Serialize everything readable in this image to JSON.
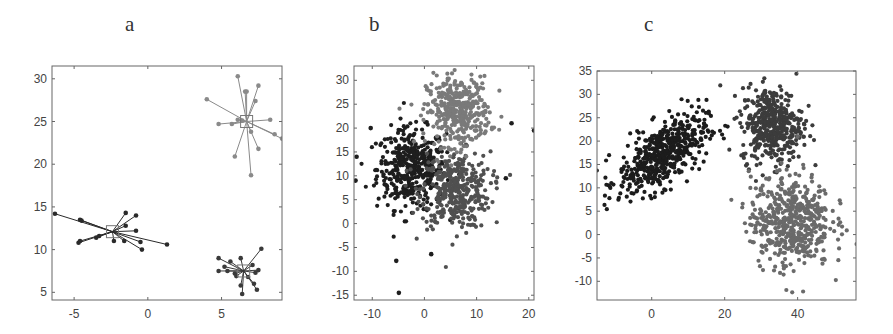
{
  "chart_data": [
    {
      "id": "a",
      "type": "scatter",
      "title": "a",
      "xlabel": "",
      "ylabel": "",
      "xlim": [
        -6.5,
        9.1
      ],
      "ylim": [
        4.1,
        31.5
      ],
      "xticks": [
        -5,
        0,
        5
      ],
      "yticks": [
        5,
        10,
        15,
        20,
        25,
        30
      ],
      "grid": false,
      "annotations": "points connected by lines to cluster centers (square markers)",
      "clusters": [
        {
          "name": "cluster-top-right",
          "color": "#8a8a8a",
          "center": [
            6.7,
            25.0
          ],
          "points": [
            [
              6.1,
              30.3
            ],
            [
              6.6,
              28.5
            ],
            [
              6.7,
              28.5
            ],
            [
              7.5,
              29.2
            ],
            [
              7.3,
              27.4
            ],
            [
              4.0,
              27.6
            ],
            [
              4.8,
              24.7
            ],
            [
              5.7,
              24.7
            ],
            [
              6.1,
              25.2
            ],
            [
              8.3,
              25.2
            ],
            [
              7.0,
              23.8
            ],
            [
              8.6,
              23.5
            ],
            [
              9.1,
              23.0
            ],
            [
              7.5,
              21.8
            ],
            [
              5.9,
              20.9
            ],
            [
              7.0,
              18.7
            ],
            [
              6.4,
              25.1
            ]
          ]
        },
        {
          "name": "cluster-left",
          "color": "#2a2a2a",
          "center": [
            -2.4,
            12.1
          ],
          "points": [
            [
              -6.3,
              14.2
            ],
            [
              -4.6,
              13.5
            ],
            [
              -4.5,
              13.4
            ],
            [
              -1.5,
              14.3
            ],
            [
              -0.8,
              14.0
            ],
            [
              -1.5,
              12.8
            ],
            [
              -0.8,
              12.2
            ],
            [
              -4.7,
              10.8
            ],
            [
              -4.6,
              11.0
            ],
            [
              -3.5,
              11.4
            ],
            [
              -3.3,
              11.6
            ],
            [
              -2.3,
              11.0
            ],
            [
              -1.6,
              11.0
            ],
            [
              -0.5,
              10.9
            ],
            [
              -0.4,
              10.0
            ],
            [
              1.3,
              10.6
            ]
          ]
        },
        {
          "name": "cluster-bottom-right",
          "color": "#3a3a3a",
          "center": [
            6.5,
            7.5
          ],
          "points": [
            [
              4.8,
              9.0
            ],
            [
              5.6,
              8.6
            ],
            [
              6.3,
              9.0
            ],
            [
              7.7,
              10.1
            ],
            [
              5.2,
              8.0
            ],
            [
              4.8,
              7.5
            ],
            [
              5.4,
              7.5
            ],
            [
              5.9,
              7.2
            ],
            [
              7.1,
              8.2
            ],
            [
              7.5,
              7.6
            ],
            [
              7.3,
              7.3
            ],
            [
              6.0,
              6.9
            ],
            [
              6.3,
              5.8
            ],
            [
              7.2,
              6.0
            ],
            [
              7.4,
              5.3
            ],
            [
              6.4,
              4.8
            ],
            [
              6.8,
              6.8
            ]
          ]
        }
      ]
    },
    {
      "id": "b",
      "type": "scatter",
      "title": "b",
      "xlabel": "",
      "ylabel": "",
      "xlim": [
        -13.5,
        21
      ],
      "ylim": [
        -16,
        33
      ],
      "xticks": [
        -10,
        0,
        10,
        20
      ],
      "yticks": [
        -15,
        -10,
        -5,
        0,
        5,
        10,
        15,
        20,
        25,
        30
      ],
      "grid": false,
      "clusters": [
        {
          "name": "cluster-dark",
          "color": "#1e1e1e",
          "center": [
            -2.5,
            11.5
          ],
          "std": [
            3.3,
            4.2
          ],
          "n": 420
        },
        {
          "name": "cluster-mid",
          "color": "#505050",
          "center": [
            6.0,
            7.0
          ],
          "std": [
            3.3,
            4.0
          ],
          "n": 380
        },
        {
          "name": "cluster-light",
          "color": "#7a7a7a",
          "center": [
            6.5,
            23.5
          ],
          "std": [
            3.0,
            3.6
          ],
          "n": 380
        }
      ],
      "outliers": [
        [
          -10.3,
          20
        ],
        [
          -13,
          14
        ],
        [
          -13.2,
          9
        ],
        [
          -5.4,
          -7.8
        ],
        [
          -4.9,
          -14.5
        ],
        [
          1.3,
          -6.4
        ],
        [
          15.6,
          9.5
        ],
        [
          21,
          19.5
        ],
        [
          16.7,
          21
        ]
      ]
    },
    {
      "id": "c",
      "type": "scatter",
      "title": "c",
      "xlabel": "",
      "ylabel": "",
      "xlim": [
        -15,
        56
      ],
      "ylim": [
        -14,
        35
      ],
      "xticks": [
        0,
        20,
        40
      ],
      "yticks": [
        -10,
        -5,
        0,
        5,
        10,
        15,
        20,
        25,
        30,
        35
      ],
      "grid": false,
      "clusters": [
        {
          "name": "cluster-dark",
          "color": "#1c1c1c",
          "center": [
            3.0,
            17.0
          ],
          "std": [
            6.0,
            4.2
          ],
          "corr": 0.6,
          "n": 520
        },
        {
          "name": "cluster-mid",
          "color": "#3c3c3c",
          "center": [
            33.0,
            23.5
          ],
          "std": [
            4.2,
            4.0
          ],
          "n": 430
        },
        {
          "name": "cluster-light",
          "color": "#6a6a6a",
          "center": [
            38.0,
            3.0
          ],
          "std": [
            5.5,
            5.0
          ],
          "n": 520
        }
      ]
    }
  ]
}
